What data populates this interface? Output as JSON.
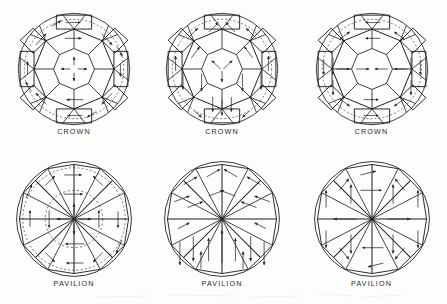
{
  "figure": {
    "background_color": "#fdfdfc",
    "line_color": "#1a1a1a",
    "arrow_color": "#2a2a2a",
    "columns": 3,
    "rows": 2
  },
  "diagrams": [
    {
      "id": "crown-1",
      "label": "CROWN",
      "section": "crown",
      "column": 1,
      "center_marker": "four-way-cross-arrows",
      "center_arrow_count": 4,
      "description": "Crown facets with four-way cross grain arrows at the table center"
    },
    {
      "id": "crown-2",
      "label": "CROWN",
      "section": "crown",
      "column": 2,
      "center_marker": "three-way-y-arrows",
      "center_arrow_count": 3,
      "description": "Crown facets with three-way Y grain arrows at the table center"
    },
    {
      "id": "crown-3",
      "label": "CROWN",
      "section": "crown",
      "column": 3,
      "center_marker": "horizontal-opposed-arrows",
      "center_arrow_count": 2,
      "description": "Crown facets with horizontal opposed grain arrows across the table"
    },
    {
      "id": "pavilion-1",
      "label": "PAVILION",
      "section": "pavilion",
      "column": 1,
      "center_marker": "four-way-cross-arrows",
      "center_arrow_count": 4,
      "description": "Pavilion main facets with four-way cross arrows at the culet"
    },
    {
      "id": "pavilion-2",
      "label": "PAVILION",
      "section": "pavilion",
      "column": 2,
      "center_marker": "radial-diagonal-arrows",
      "center_arrow_count": 0,
      "description": "Pavilion main facets with diagonal arrows above and vertical arrows below"
    },
    {
      "id": "pavilion-3",
      "label": "PAVILION",
      "section": "pavilion",
      "column": 3,
      "center_marker": "horizontal-opposed-arrows",
      "center_arrow_count": 2,
      "description": "Pavilion main facets with horizontal opposed arrows at the culet"
    }
  ],
  "geometry": {
    "girdle_radius": 60,
    "table_radius": 22,
    "bezel_radius": 40,
    "star_points": 8,
    "pavilion_mains": 8,
    "lower_girdle_facets": 16,
    "upper_girdle_facets": 16
  }
}
